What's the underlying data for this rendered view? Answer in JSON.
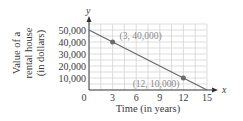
{
  "chart_data": {
    "type": "line",
    "title": "",
    "xlabel": "Time (in years)",
    "ylabel": "Value of a rental house (in dollars)",
    "ylabel_lines": [
      "Value of a",
      "rental house",
      "(in dollars)"
    ],
    "x_axis_symbol": "x",
    "y_axis_symbol": "y",
    "x_ticks": [
      "0",
      "3",
      "6",
      "9",
      "12",
      "15"
    ],
    "y_ticks": [
      "10,000",
      "20,000",
      "30,000",
      "40,000",
      "50,000"
    ],
    "xlim": [
      0,
      15
    ],
    "ylim": [
      0,
      55000
    ],
    "grid": true,
    "series": [
      {
        "name": "Value",
        "x": [
          0,
          3,
          12,
          15
        ],
        "y": [
          50000,
          40000,
          10000,
          0
        ]
      }
    ],
    "points": [
      {
        "x": 3,
        "y": 40000,
        "label": "(3, 40,000)"
      },
      {
        "x": 12,
        "y": 10000,
        "label": "(12, 10,000)"
      }
    ],
    "colors": {
      "line": "#6b6b6b",
      "grid": "#d4d4d4",
      "axis": "#333333",
      "point": "#6b6b6b"
    }
  }
}
